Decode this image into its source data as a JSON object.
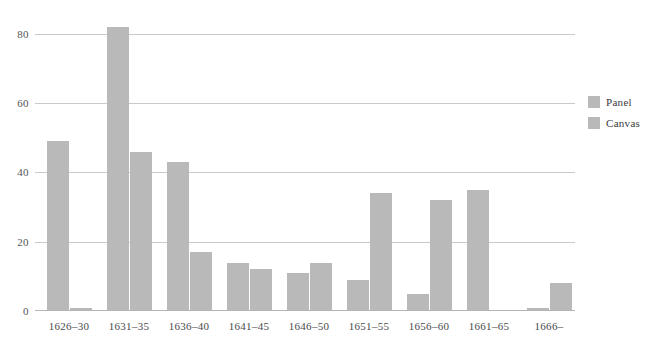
{
  "chart_data": {
    "type": "bar",
    "title": "",
    "xlabel": "",
    "ylabel": "",
    "categories": [
      "1626–30",
      "1631–35",
      "1636–40",
      "1641–45",
      "1646–50",
      "1651–55",
      "1656–60",
      "1661–65",
      "1666–"
    ],
    "series": [
      {
        "name": "Panel",
        "values": [
          49,
          82,
          43,
          14,
          11,
          9,
          5,
          35,
          1
        ]
      },
      {
        "name": "Canvas",
        "values": [
          1,
          46,
          17,
          12,
          14,
          34,
          32,
          0,
          8
        ]
      }
    ],
    "ylim": [
      0,
      84
    ],
    "yticks": [
      0,
      20,
      40,
      60,
      80
    ],
    "ytick_labels": [
      "0",
      "20",
      "40",
      "60",
      "80"
    ],
    "grid": "horizontal",
    "legend_position": "right",
    "colors": {
      "panel": "#b9b9b9",
      "canvas": "#b9b9b9",
      "gridline": "#c9c9c9",
      "background": "#ffffff"
    }
  },
  "legend": {
    "items": [
      {
        "label": "Panel"
      },
      {
        "label": "Canvas"
      }
    ]
  }
}
